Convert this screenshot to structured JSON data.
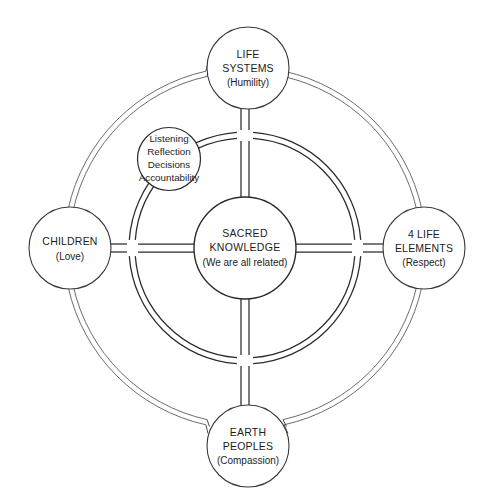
{
  "diagram": {
    "center": {
      "name": "sacred-knowledge",
      "line1": "SACRED",
      "line2": "KNOWLEDGE",
      "line3": "(We are all related)"
    },
    "nodes": [
      {
        "position": "top",
        "name": "life-systems",
        "line1": "LIFE",
        "line2": "SYSTEMS",
        "line3": "(Humility)"
      },
      {
        "position": "right",
        "name": "four-life-elements",
        "line1": "4 LIFE",
        "line2": "ELEMENTS",
        "line3": "(Respect)"
      },
      {
        "position": "bottom",
        "name": "earth-peoples",
        "line1": "EARTH",
        "line2": "PEOPLES",
        "line3": "(Compassion)"
      },
      {
        "position": "left",
        "name": "children",
        "line1": "CHILDREN",
        "line2": "(Love)",
        "line3": ""
      }
    ],
    "process_circle": {
      "name": "process-values",
      "items": [
        "Listening",
        "Reflection",
        "Decisions",
        "Accountability"
      ]
    },
    "colors": {
      "background": "#ffffff",
      "stroke_dark": "#2b2b2b",
      "stroke_mid": "#3a3a3a",
      "stroke_light": "#5a5a5a",
      "text": "#1c1c1c"
    }
  }
}
